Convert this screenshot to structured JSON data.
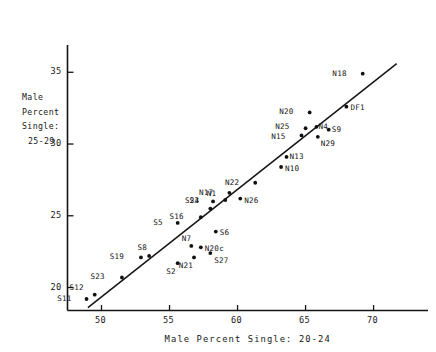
{
  "chart_data": {
    "type": "scatter",
    "title": "",
    "xlabel": "Male Percent Single: 20-24",
    "ylabel": "Male Percent Single: 25-29",
    "ylabel_lines": [
      "Male",
      "Percent",
      "Single:",
      "25-29"
    ],
    "xlim": [
      47.5,
      74
    ],
    "ylim": [
      18.4,
      36.9
    ],
    "xticks": [
      50,
      55,
      60,
      65,
      70
    ],
    "xticklabels": [
      "50",
      "55",
      "60",
      "65",
      "70"
    ],
    "yticks": [
      20,
      25,
      30,
      35
    ],
    "yticklabels": [
      "20",
      "25",
      "30",
      "35"
    ],
    "grid": false,
    "legend": null,
    "trendline": {
      "x": [
        49.0,
        71.7
      ],
      "y": [
        18.6,
        35.6
      ]
    },
    "points": [
      {
        "label": "S11",
        "x": 48.9,
        "y": 19.2,
        "lx": -16,
        "ly": -1
      },
      {
        "label": "S12",
        "x": 49.5,
        "y": 19.5,
        "lx": -12,
        "ly": -8
      },
      {
        "label": "S23",
        "x": 51.5,
        "y": 20.7,
        "lx": -18,
        "ly": -1
      },
      {
        "label": "S19",
        "x": 52.9,
        "y": 22.1,
        "lx": -18,
        "ly": -1
      },
      {
        "label": "S8",
        "x": 53.5,
        "y": 22.2,
        "lx": -3,
        "ly": -9
      },
      {
        "label": "S2",
        "x": 55.6,
        "y": 21.7,
        "lx": -3,
        "ly": 8
      },
      {
        "label": "N21",
        "x": 56.8,
        "y": 22.1,
        "lx": -2,
        "ly": 8
      },
      {
        "label": "N7",
        "x": 56.6,
        "y": 22.9,
        "lx": -1,
        "ly": -8
      },
      {
        "label": "N20c",
        "x": 57.3,
        "y": 22.8,
        "lx": 4,
        "ly": 1
      },
      {
        "label": "S27",
        "x": 58.0,
        "y": 22.4,
        "lx": 4,
        "ly": 7
      },
      {
        "label": "S6",
        "x": 58.4,
        "y": 23.9,
        "lx": 4,
        "ly": 1
      },
      {
        "label": "S5",
        "x": 55.6,
        "y": 24.5,
        "lx": -16,
        "ly": -1
      },
      {
        "label": "S16",
        "x": 57.3,
        "y": 24.9,
        "lx": -18,
        "ly": -1
      },
      {
        "label": "S24",
        "x": 58.0,
        "y": 25.5,
        "lx": -12,
        "ly": -8
      },
      {
        "label": "S3",
        "x": 58.2,
        "y": 26.0,
        "lx": -15,
        "ly": -1
      },
      {
        "label": "N1",
        "x": 59.1,
        "y": 26.1,
        "lx": -10,
        "ly": -7
      },
      {
        "label": "N17",
        "x": 59.4,
        "y": 26.6,
        "lx": -17,
        "ly": -1
      },
      {
        "label": "N26",
        "x": 60.2,
        "y": 26.2,
        "lx": 4,
        "ly": 2
      },
      {
        "label": "N22",
        "x": 61.3,
        "y": 27.3,
        "lx": -17,
        "ly": -1
      },
      {
        "label": "N10",
        "x": 63.2,
        "y": 28.4,
        "lx": 4,
        "ly": 1
      },
      {
        "label": "N13",
        "x": 63.6,
        "y": 29.1,
        "lx": 3,
        "ly": -1
      },
      {
        "label": "N15",
        "x": 64.7,
        "y": 30.6,
        "lx": -17,
        "ly": 1
      },
      {
        "label": "N25",
        "x": 65.0,
        "y": 31.1,
        "lx": -17,
        "ly": -2
      },
      {
        "label": "N29",
        "x": 65.9,
        "y": 30.5,
        "lx": 3,
        "ly": 6
      },
      {
        "label": "N4",
        "x": 65.8,
        "y": 31.2,
        "lx": 2,
        "ly": -1
      },
      {
        "label": "S9",
        "x": 66.7,
        "y": 31.0,
        "lx": 3,
        "ly": 0
      },
      {
        "label": "N20",
        "x": 65.3,
        "y": 32.2,
        "lx": -17,
        "ly": -1
      },
      {
        "label": "DF1",
        "x": 68.0,
        "y": 32.6,
        "lx": 4,
        "ly": 0
      },
      {
        "label": "N18",
        "x": 69.2,
        "y": 34.9,
        "lx": -17,
        "ly": -1
      }
    ]
  }
}
